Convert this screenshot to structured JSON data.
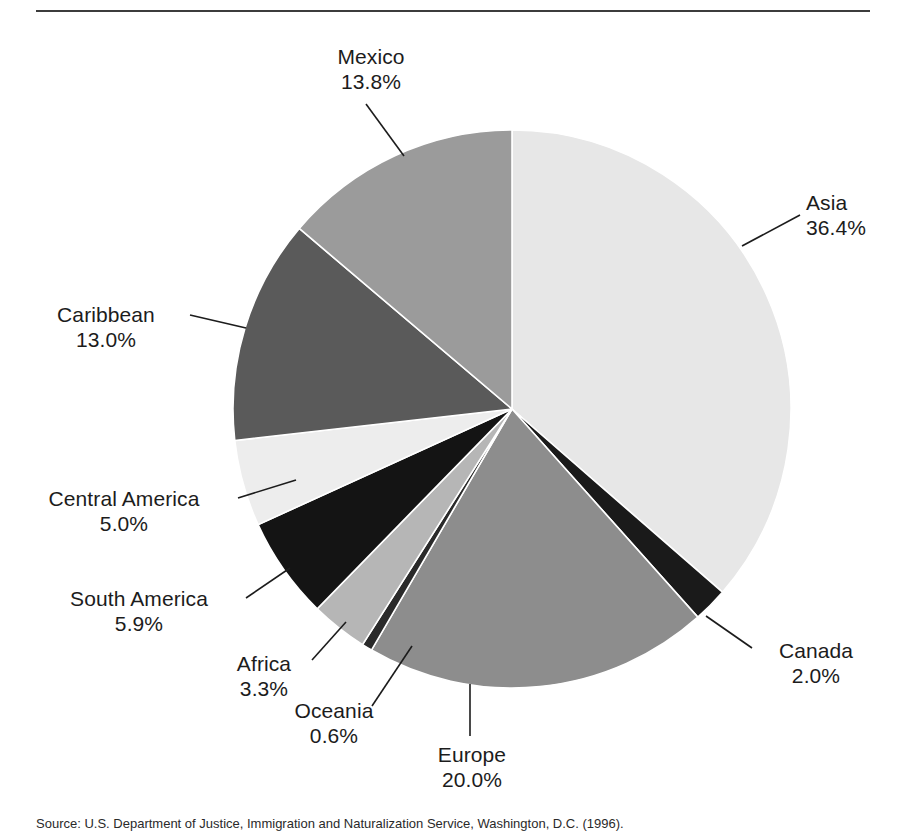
{
  "page": {
    "background": "#ffffff",
    "rule_color": "#3c3c3c"
  },
  "caption": {
    "text": "Source: U.S. Department of Justice, Immigration and Naturalization Service, Washington, D.C. (1996)."
  },
  "chart_data": {
    "type": "pie",
    "title": "",
    "subtitle": "",
    "xlabel": "",
    "ylabel": "",
    "legend_position": "callout-labels",
    "start_angle_deg": 0,
    "direction": "clockwise",
    "units": "percent",
    "categories": [
      "Asia",
      "Canada",
      "Europe",
      "Oceania",
      "Africa",
      "South America",
      "Central America",
      "Caribbean",
      "Mexico"
    ],
    "values": [
      36.4,
      2.0,
      20.0,
      0.6,
      3.3,
      5.9,
      5.0,
      13.0,
      13.8
    ],
    "slices": [
      {
        "label": "Asia",
        "percent": "36.4%",
        "value": 36.4,
        "color": "#e7e7e7"
      },
      {
        "label": "Canada",
        "percent": "2.0%",
        "value": 2.0,
        "color": "#1a1a1a"
      },
      {
        "label": "Europe",
        "percent": "20.0%",
        "value": 20.0,
        "color": "#8d8d8d"
      },
      {
        "label": "Oceania",
        "percent": "0.6%",
        "value": 0.6,
        "color": "#2a2a2a"
      },
      {
        "label": "Africa",
        "percent": "3.3%",
        "value": 3.3,
        "color": "#b6b6b6"
      },
      {
        "label": "South America",
        "percent": "5.9%",
        "value": 5.9,
        "color": "#141414"
      },
      {
        "label": "Central America",
        "percent": "5.0%",
        "value": 5.0,
        "color": "#ededed"
      },
      {
        "label": "Caribbean",
        "percent": "13.0%",
        "value": 13.0,
        "color": "#5a5a5a"
      },
      {
        "label": "Mexico",
        "percent": "13.8%",
        "value": 13.8,
        "color": "#9b9b9b"
      }
    ]
  }
}
